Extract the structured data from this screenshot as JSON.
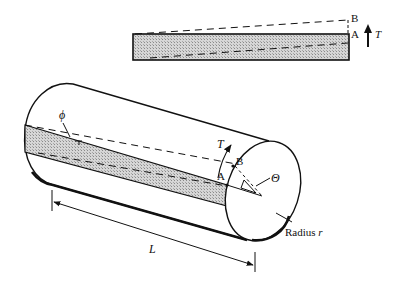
{
  "figure": {
    "type": "torsion-of-cylindrical-shaft",
    "inset": {
      "labels": {
        "B": "B",
        "A": "A",
        "torque": "T"
      }
    },
    "cylinder": {
      "labels": {
        "shear_angle": "ϕ",
        "torque": "T",
        "point_A": "A",
        "point_B": "B",
        "twist_angle": "Θ",
        "radius": "Radius ",
        "radius_symbol": "r",
        "length": "L"
      }
    },
    "colors": {
      "line": "#111111",
      "hatch": "#bdbdbd",
      "background": "#ffffff"
    }
  }
}
